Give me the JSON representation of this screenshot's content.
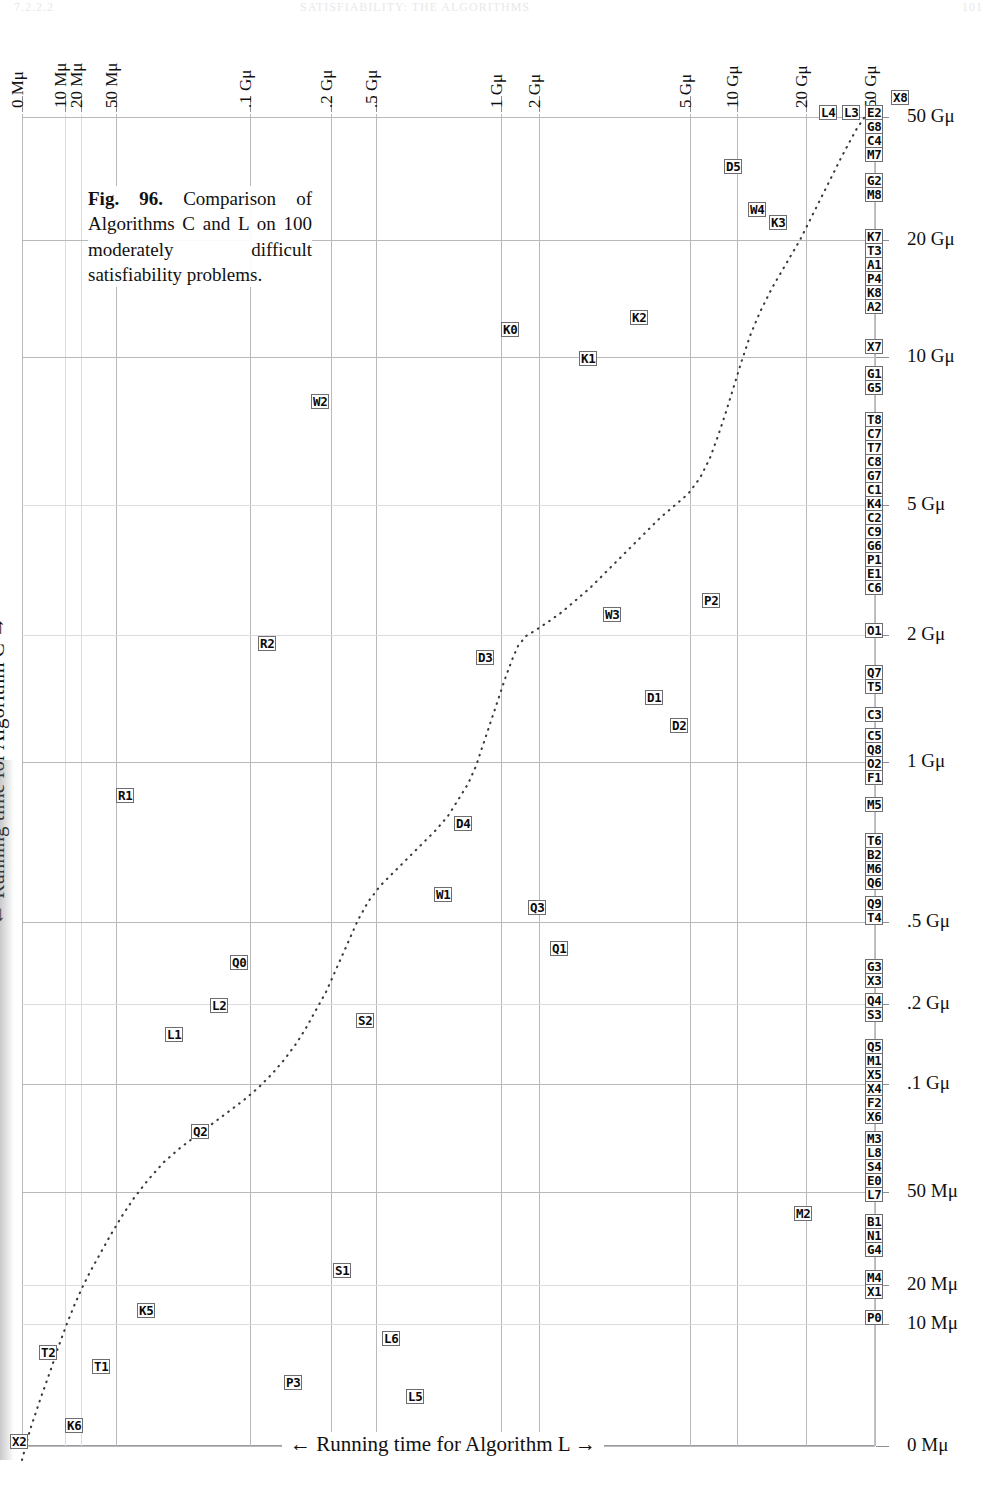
{
  "header": {
    "folio": "7.2.2.2",
    "title": "SATISFIABILITY: THE ALGORITHMS",
    "page": "101"
  },
  "caption": {
    "figure_label": "Fig. 96.",
    "text": " Comparison of Algorithms C and L on 100 moderately difficult satisfiability problems."
  },
  "axes": {
    "xlabel": "← Running time for Algorithm L →",
    "ylabel": "← Running time for Algorithm C →",
    "x_ticks": [
      {
        "label": "0 Mμ",
        "px": 22
      },
      {
        "label": "10 Mμ",
        "px": 65
      },
      {
        "label": "20 Mμ",
        "px": 81
      },
      {
        "label": "50 Mμ",
        "px": 116
      },
      {
        "label": ".1 Gμ",
        "px": 250
      },
      {
        "label": ".2 Gμ",
        "px": 331
      },
      {
        "label": ".5 Gμ",
        "px": 376
      },
      {
        "label": "1 Gμ",
        "px": 501
      },
      {
        "label": "2 Gμ",
        "px": 539
      },
      {
        "label": "5 Gμ",
        "px": 690
      },
      {
        "label": "10 Gμ",
        "px": 737
      },
      {
        "label": "20 Gμ",
        "px": 806
      },
      {
        "label": "50 Gμ",
        "px": 875
      }
    ],
    "y_ticks": [
      {
        "label": "50 Gμ",
        "px": 117
      },
      {
        "label": "20 Gμ",
        "px": 240
      },
      {
        "label": "10 Gμ",
        "px": 357
      },
      {
        "label": "5 Gμ",
        "px": 505
      },
      {
        "label": "2 Gμ",
        "px": 635
      },
      {
        "label": "1 Gμ",
        "px": 762
      },
      {
        "label": ".5 Gμ",
        "px": 922
      },
      {
        "label": ".2 Gμ",
        "px": 1004
      },
      {
        "label": ".1 Gμ",
        "px": 1084
      },
      {
        "label": "50 Mμ",
        "px": 1192
      },
      {
        "label": "20 Mμ",
        "px": 1285
      },
      {
        "label": "10 Mμ",
        "px": 1324
      },
      {
        "label": "0 Mμ",
        "px": 1446
      }
    ]
  },
  "chart_data": {
    "type": "scatter",
    "title": "Comparison of Algorithms C and L on 100 moderately difficult satisfiability problems.",
    "xlabel": "← Running time for Algorithm L →",
    "ylabel": "← Running time for Algorithm C →",
    "x_scale": "nonlinear (rank/quantile)",
    "y_scale": "nonlinear (rank/quantile)",
    "x_tick_labels": [
      "0 Mμ",
      "10 Mμ",
      "20 Mμ",
      "50 Mμ",
      ".1 Gμ",
      ".2 Gμ",
      ".5 Gμ",
      "1 Gμ",
      "2 Gμ",
      "5 Gμ",
      "10 Gμ",
      "20 Gμ",
      "50 Gμ"
    ],
    "y_tick_labels": [
      "0 Mμ",
      "10 Mμ",
      "20 Mμ",
      "50 Mμ",
      ".1 Gμ",
      ".2 Gμ",
      ".5 Gμ",
      "1 Gμ",
      "2 Gμ",
      "5 Gμ",
      "10 Gμ",
      "20 Gμ",
      "50 Gμ"
    ],
    "grid": true,
    "legend": "none",
    "note": "Each point is a labelled problem instance; points pinned at the right edge exceeded the L time limit. The dotted curve is the diagonal reference trace.",
    "points": [
      {
        "label": "X8",
        "x": 903,
        "y": 97,
        "pinned": true
      },
      {
        "label": "L4",
        "x": 831,
        "y": 112,
        "pinned": false
      },
      {
        "label": "L3",
        "x": 854,
        "y": 112,
        "pinned": false
      },
      {
        "label": "E2",
        "x": 877,
        "y": 112,
        "pinned": true
      },
      {
        "label": "G8",
        "x": 877,
        "y": 126,
        "pinned": true
      },
      {
        "label": "C4",
        "x": 877,
        "y": 140,
        "pinned": true
      },
      {
        "label": "M7",
        "x": 877,
        "y": 154,
        "pinned": true
      },
      {
        "label": "D5",
        "x": 736,
        "y": 166,
        "pinned": false
      },
      {
        "label": "G2",
        "x": 877,
        "y": 180,
        "pinned": true
      },
      {
        "label": "M8",
        "x": 877,
        "y": 194,
        "pinned": true
      },
      {
        "label": "W4",
        "x": 760,
        "y": 209,
        "pinned": false
      },
      {
        "label": "K3",
        "x": 781,
        "y": 222,
        "pinned": false
      },
      {
        "label": "K7",
        "x": 877,
        "y": 236,
        "pinned": true
      },
      {
        "label": "T3",
        "x": 877,
        "y": 250,
        "pinned": true
      },
      {
        "label": "A1",
        "x": 877,
        "y": 264,
        "pinned": true
      },
      {
        "label": "P4",
        "x": 877,
        "y": 278,
        "pinned": true
      },
      {
        "label": "K8",
        "x": 877,
        "y": 292,
        "pinned": true
      },
      {
        "label": "A2",
        "x": 877,
        "y": 306,
        "pinned": true
      },
      {
        "label": "K0",
        "x": 513,
        "y": 329,
        "pinned": false
      },
      {
        "label": "K2",
        "x": 642,
        "y": 317,
        "pinned": false
      },
      {
        "label": "X7",
        "x": 877,
        "y": 346,
        "pinned": true
      },
      {
        "label": "K1",
        "x": 591,
        "y": 358,
        "pinned": false
      },
      {
        "label": "G1",
        "x": 877,
        "y": 373,
        "pinned": true
      },
      {
        "label": "G5",
        "x": 877,
        "y": 387,
        "pinned": true
      },
      {
        "label": "W2",
        "x": 323,
        "y": 401,
        "pinned": false
      },
      {
        "label": "T8",
        "x": 877,
        "y": 419,
        "pinned": true
      },
      {
        "label": "C7",
        "x": 877,
        "y": 433,
        "pinned": true
      },
      {
        "label": "T7",
        "x": 877,
        "y": 447,
        "pinned": true
      },
      {
        "label": "C8",
        "x": 877,
        "y": 461,
        "pinned": true
      },
      {
        "label": "G7",
        "x": 877,
        "y": 475,
        "pinned": true
      },
      {
        "label": "C1",
        "x": 877,
        "y": 489,
        "pinned": true
      },
      {
        "label": "K4",
        "x": 877,
        "y": 503,
        "pinned": true
      },
      {
        "label": "C2",
        "x": 877,
        "y": 517,
        "pinned": true
      },
      {
        "label": "C9",
        "x": 877,
        "y": 531,
        "pinned": true
      },
      {
        "label": "G6",
        "x": 877,
        "y": 545,
        "pinned": true
      },
      {
        "label": "P1",
        "x": 877,
        "y": 559,
        "pinned": true
      },
      {
        "label": "E1",
        "x": 877,
        "y": 573,
        "pinned": true
      },
      {
        "label": "C6",
        "x": 877,
        "y": 587,
        "pinned": true
      },
      {
        "label": "W3",
        "x": 615,
        "y": 614,
        "pinned": false
      },
      {
        "label": "P2",
        "x": 714,
        "y": 600,
        "pinned": false
      },
      {
        "label": "O1",
        "x": 877,
        "y": 630,
        "pinned": true
      },
      {
        "label": "R2",
        "x": 270,
        "y": 643,
        "pinned": false
      },
      {
        "label": "D3",
        "x": 488,
        "y": 657,
        "pinned": false
      },
      {
        "label": "Q7",
        "x": 877,
        "y": 672,
        "pinned": true
      },
      {
        "label": "T5",
        "x": 877,
        "y": 686,
        "pinned": true
      },
      {
        "label": "D1",
        "x": 657,
        "y": 697,
        "pinned": false
      },
      {
        "label": "D2",
        "x": 682,
        "y": 725,
        "pinned": false
      },
      {
        "label": "C3",
        "x": 877,
        "y": 714,
        "pinned": true
      },
      {
        "label": "C5",
        "x": 877,
        "y": 735,
        "pinned": true
      },
      {
        "label": "Q8",
        "x": 877,
        "y": 749,
        "pinned": true
      },
      {
        "label": "O2",
        "x": 877,
        "y": 763,
        "pinned": true
      },
      {
        "label": "F1",
        "x": 877,
        "y": 777,
        "pinned": true
      },
      {
        "label": "R1",
        "x": 128,
        "y": 795,
        "pinned": false
      },
      {
        "label": "M5",
        "x": 877,
        "y": 804,
        "pinned": true
      },
      {
        "label": "D4",
        "x": 466,
        "y": 823,
        "pinned": false
      },
      {
        "label": "T6",
        "x": 877,
        "y": 840,
        "pinned": true
      },
      {
        "label": "B2",
        "x": 877,
        "y": 854,
        "pinned": true
      },
      {
        "label": "M6",
        "x": 877,
        "y": 868,
        "pinned": true
      },
      {
        "label": "Q6",
        "x": 877,
        "y": 882,
        "pinned": true
      },
      {
        "label": "W1",
        "x": 446,
        "y": 894,
        "pinned": false
      },
      {
        "label": "Q3",
        "x": 540,
        "y": 907,
        "pinned": false
      },
      {
        "label": "Q9",
        "x": 877,
        "y": 903,
        "pinned": true
      },
      {
        "label": "T4",
        "x": 877,
        "y": 917,
        "pinned": true
      },
      {
        "label": "Q1",
        "x": 562,
        "y": 948,
        "pinned": false
      },
      {
        "label": "Q0",
        "x": 242,
        "y": 962,
        "pinned": false
      },
      {
        "label": "G3",
        "x": 877,
        "y": 966,
        "pinned": true
      },
      {
        "label": "X3",
        "x": 877,
        "y": 980,
        "pinned": true
      },
      {
        "label": "L2",
        "x": 222,
        "y": 1005,
        "pinned": false
      },
      {
        "label": "Q4",
        "x": 877,
        "y": 1000,
        "pinned": true
      },
      {
        "label": "S3",
        "x": 877,
        "y": 1014,
        "pinned": true
      },
      {
        "label": "L1",
        "x": 177,
        "y": 1034,
        "pinned": false
      },
      {
        "label": "S2",
        "x": 368,
        "y": 1020,
        "pinned": false
      },
      {
        "label": "Q5",
        "x": 877,
        "y": 1046,
        "pinned": true
      },
      {
        "label": "M1",
        "x": 877,
        "y": 1060,
        "pinned": true
      },
      {
        "label": "X5",
        "x": 877,
        "y": 1074,
        "pinned": true
      },
      {
        "label": "X4",
        "x": 877,
        "y": 1088,
        "pinned": true
      },
      {
        "label": "F2",
        "x": 877,
        "y": 1102,
        "pinned": true
      },
      {
        "label": "X6",
        "x": 877,
        "y": 1116,
        "pinned": true
      },
      {
        "label": "Q2",
        "x": 203,
        "y": 1131,
        "pinned": false
      },
      {
        "label": "M3",
        "x": 877,
        "y": 1138,
        "pinned": true
      },
      {
        "label": "L8",
        "x": 877,
        "y": 1152,
        "pinned": true
      },
      {
        "label": "S4",
        "x": 877,
        "y": 1166,
        "pinned": true
      },
      {
        "label": "E0",
        "x": 877,
        "y": 1180,
        "pinned": true
      },
      {
        "label": "L7",
        "x": 877,
        "y": 1194,
        "pinned": true
      },
      {
        "label": "M2",
        "x": 806,
        "y": 1213,
        "pinned": false
      },
      {
        "label": "B1",
        "x": 877,
        "y": 1221,
        "pinned": true
      },
      {
        "label": "N1",
        "x": 877,
        "y": 1235,
        "pinned": true
      },
      {
        "label": "G4",
        "x": 877,
        "y": 1249,
        "pinned": true
      },
      {
        "label": "S1",
        "x": 345,
        "y": 1270,
        "pinned": false
      },
      {
        "label": "M4",
        "x": 877,
        "y": 1277,
        "pinned": true
      },
      {
        "label": "X1",
        "x": 877,
        "y": 1291,
        "pinned": true
      },
      {
        "label": "K5",
        "x": 149,
        "y": 1310,
        "pinned": false
      },
      {
        "label": "P0",
        "x": 877,
        "y": 1317,
        "pinned": true
      },
      {
        "label": "L6",
        "x": 394,
        "y": 1338,
        "pinned": false
      },
      {
        "label": "T2",
        "x": 51,
        "y": 1352,
        "pinned": false
      },
      {
        "label": "T1",
        "x": 104,
        "y": 1366,
        "pinned": false
      },
      {
        "label": "P3",
        "x": 296,
        "y": 1382,
        "pinned": false
      },
      {
        "label": "L5",
        "x": 418,
        "y": 1396,
        "pinned": false
      },
      {
        "label": "X2",
        "x": 22,
        "y": 1441,
        "pinned": false
      },
      {
        "label": "K6",
        "x": 77,
        "y": 1425,
        "pinned": false
      }
    ],
    "trend_curve": {
      "style": "dotted",
      "description": "Diagonal reference curve y = x rendered through the rank-transformed coordinates",
      "points_px": [
        [
          22,
          1460
        ],
        [
          30,
          1430
        ],
        [
          40,
          1400
        ],
        [
          50,
          1372
        ],
        [
          58,
          1348
        ],
        [
          66,
          1326
        ],
        [
          74,
          1306
        ],
        [
          82,
          1288
        ],
        [
          90,
          1272
        ],
        [
          100,
          1254
        ],
        [
          110,
          1236
        ],
        [
          122,
          1216
        ],
        [
          134,
          1198
        ],
        [
          148,
          1180
        ],
        [
          164,
          1162
        ],
        [
          180,
          1148
        ],
        [
          196,
          1136
        ],
        [
          212,
          1124
        ],
        [
          228,
          1112
        ],
        [
          244,
          1100
        ],
        [
          258,
          1088
        ],
        [
          272,
          1074
        ],
        [
          284,
          1060
        ],
        [
          296,
          1044
        ],
        [
          306,
          1028
        ],
        [
          316,
          1010
        ],
        [
          326,
          992
        ],
        [
          334,
          974
        ],
        [
          342,
          956
        ],
        [
          350,
          938
        ],
        [
          358,
          920
        ],
        [
          368,
          902
        ],
        [
          380,
          886
        ],
        [
          394,
          872
        ],
        [
          408,
          858
        ],
        [
          422,
          844
        ],
        [
          436,
          830
        ],
        [
          448,
          816
        ],
        [
          458,
          800
        ],
        [
          468,
          784
        ],
        [
          476,
          766
        ],
        [
          482,
          748
        ],
        [
          488,
          730
        ],
        [
          494,
          712
        ],
        [
          500,
          694
        ],
        [
          506,
          676
        ],
        [
          512,
          660
        ],
        [
          518,
          646
        ],
        [
          526,
          636
        ],
        [
          536,
          630
        ],
        [
          548,
          622
        ],
        [
          562,
          612
        ],
        [
          576,
          600
        ],
        [
          590,
          588
        ],
        [
          604,
          574
        ],
        [
          618,
          560
        ],
        [
          632,
          546
        ],
        [
          646,
          532
        ],
        [
          660,
          518
        ],
        [
          674,
          506
        ],
        [
          688,
          494
        ],
        [
          700,
          478
        ],
        [
          710,
          458
        ],
        [
          718,
          436
        ],
        [
          726,
          412
        ],
        [
          734,
          386
        ],
        [
          742,
          360
        ],
        [
          750,
          336
        ],
        [
          760,
          312
        ],
        [
          772,
          288
        ],
        [
          786,
          264
        ],
        [
          800,
          240
        ],
        [
          814,
          212
        ],
        [
          828,
          184
        ],
        [
          842,
          156
        ],
        [
          856,
          130
        ],
        [
          868,
          112
        ]
      ]
    }
  }
}
